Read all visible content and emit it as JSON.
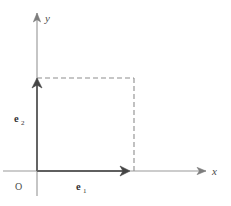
{
  "figure": {
    "kind": "vector-basis-diagram",
    "background_color": "#ffffff",
    "width": 231,
    "height": 206
  },
  "axes": {
    "x": {
      "label": "x",
      "label_x": 212,
      "label_y": 175,
      "line_color": "#9a9a9a",
      "arrow_color": "#7d7d7d",
      "start_x": 3,
      "end_x": 206,
      "y": 171
    },
    "y": {
      "label": "y",
      "label_x": 45,
      "label_y": 22,
      "line_color": "#9a9a9a",
      "arrow_color": "#7d7d7d",
      "start_y": 196,
      "end_y": 13,
      "x": 37
    },
    "origin": {
      "label": "O",
      "label_x": 15,
      "label_y": 190,
      "x": 37,
      "y": 171
    }
  },
  "vectors": [
    {
      "name": "e",
      "subscript": "1",
      "label_x": 76,
      "label_y": 190,
      "color": "#5f5f5f",
      "from_x": 37,
      "from_y": 171,
      "to_x": 129,
      "to_y": 171,
      "stroke_width": 1.9
    },
    {
      "name": "e",
      "subscript": "2",
      "label_x": 14,
      "label_y": 122,
      "color": "#5f5f5f",
      "from_x": 37,
      "from_y": 171,
      "to_x": 37,
      "to_y": 79,
      "stroke_width": 1.9
    }
  ],
  "dashed_lines": [
    {
      "name": "horizontal-guide",
      "from_x": 37,
      "from_y": 78,
      "to_x": 134,
      "to_y": 78,
      "color": "#8e8e8e",
      "dash": "5 3"
    },
    {
      "name": "vertical-guide",
      "from_x": 134,
      "from_y": 78,
      "to_x": 134,
      "to_y": 171,
      "color": "#8e8e8e",
      "dash": "5 3"
    }
  ]
}
